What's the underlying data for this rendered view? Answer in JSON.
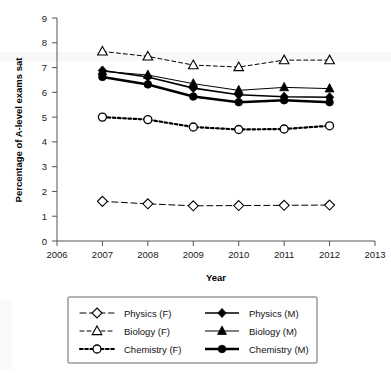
{
  "chart_data": {
    "type": "line",
    "title": "",
    "xlabel": "Year",
    "ylabel": "Percentage of A-level exams sat",
    "x": [
      2007,
      2008,
      2009,
      2010,
      2011,
      2012
    ],
    "xlim": [
      2006,
      2013
    ],
    "ylim": [
      0,
      9
    ],
    "xticks": [
      "2006",
      "2007",
      "2008",
      "2009",
      "2010",
      "2011",
      "2012",
      "2013"
    ],
    "yticks": [
      "0",
      "1",
      "2",
      "3",
      "4",
      "5",
      "6",
      "7",
      "8",
      "9"
    ],
    "grid": false,
    "legend_position": "below",
    "series": [
      {
        "name": "Physics (F)",
        "marker": "open-diamond",
        "line_style": "dashed",
        "line_width": 1,
        "color": "#000000",
        "values": [
          1.6,
          1.5,
          1.42,
          1.43,
          1.44,
          1.45
        ]
      },
      {
        "name": "Biology (F)",
        "marker": "open-triangle",
        "line_style": "dashed-fine",
        "line_width": 1,
        "color": "#000000",
        "values": [
          7.65,
          7.45,
          7.1,
          7.02,
          7.3,
          7.3
        ]
      },
      {
        "name": "Chemistry (F)",
        "marker": "open-circle",
        "line_style": "dotted",
        "line_width": 2.2,
        "color": "#000000",
        "values": [
          5.0,
          4.9,
          4.6,
          4.5,
          4.52,
          4.65
        ]
      },
      {
        "name": "Physics (M)",
        "marker": "filled-diamond",
        "line_style": "solid",
        "line_width": 1.6,
        "color": "#000000",
        "values": [
          6.88,
          6.62,
          6.17,
          5.9,
          5.82,
          5.8
        ]
      },
      {
        "name": "Biology (M)",
        "marker": "filled-triangle",
        "line_style": "solid",
        "line_width": 1,
        "color": "#000000",
        "values": [
          6.85,
          6.7,
          6.35,
          6.08,
          6.2,
          6.15
        ]
      },
      {
        "name": "Chemistry (M)",
        "marker": "filled-circle",
        "line_style": "solid",
        "line_width": 2.6,
        "color": "#000000",
        "values": [
          6.62,
          6.32,
          5.83,
          5.6,
          5.68,
          5.6
        ]
      }
    ]
  },
  "legend": {
    "entries": [
      {
        "label": "Physics (F)"
      },
      {
        "label": "Physics (M)"
      },
      {
        "label": "Biology (F)"
      },
      {
        "label": "Biology (M)"
      },
      {
        "label": "Chemistry (F)"
      },
      {
        "label": "Chemistry (M)"
      }
    ]
  }
}
